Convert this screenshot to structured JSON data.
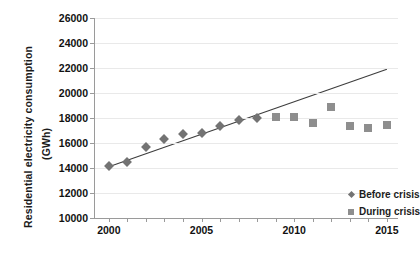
{
  "chart_data": {
    "type": "scatter",
    "title": "",
    "xlabel": "",
    "ylabel": "Residential electricity consumption (GWh)",
    "ylabel_line1": "Residential electricity consumption",
    "ylabel_line2": "(GWh)",
    "xlim": [
      1999.2,
      2015.6
    ],
    "ylim": [
      10000,
      26000
    ],
    "ytick_values": [
      10000,
      12000,
      14000,
      16000,
      18000,
      20000,
      22000,
      24000,
      26000
    ],
    "ytick_labels": [
      "10000",
      "12000",
      "14000",
      "16000",
      "18000",
      "20000",
      "22000",
      "24000",
      "26000"
    ],
    "xtick_values": [
      2000,
      2005,
      2010,
      2015
    ],
    "xtick_labels": [
      "2000",
      "2005",
      "2010",
      "2015"
    ],
    "x_minor_ticks": [
      2000,
      2001,
      2002,
      2003,
      2004,
      2005,
      2006,
      2007,
      2008,
      2009,
      2010,
      2011,
      2012,
      2013,
      2014,
      2015
    ],
    "grid": "horizontal",
    "legend_position": "inside-lower-right",
    "series": [
      {
        "name": "Before crisis",
        "marker": "diamond",
        "color": "#737373",
        "x": [
          2000,
          2001,
          2002,
          2003,
          2004,
          2005,
          2006,
          2007,
          2008
        ],
        "values": [
          14150,
          14500,
          15650,
          16350,
          16750,
          16800,
          17400,
          17850,
          18000
        ]
      },
      {
        "name": "During crisis",
        "marker": "square",
        "color": "#8e8e8e",
        "x": [
          2009,
          2010,
          2011,
          2012,
          2013,
          2014,
          2015
        ],
        "values": [
          18050,
          18050,
          17600,
          18900,
          17400,
          17200,
          17450
        ]
      }
    ],
    "trendline": {
      "name": "linear trend",
      "color": "#3d3d3d",
      "x": [
        2000,
        2015
      ],
      "values": [
        14100,
        21900
      ]
    },
    "legend": [
      {
        "label": "Before crisis",
        "marker": "diamond",
        "color": "#737373"
      },
      {
        "label": "During crisis",
        "marker": "square",
        "color": "#8e8e8e"
      }
    ]
  }
}
